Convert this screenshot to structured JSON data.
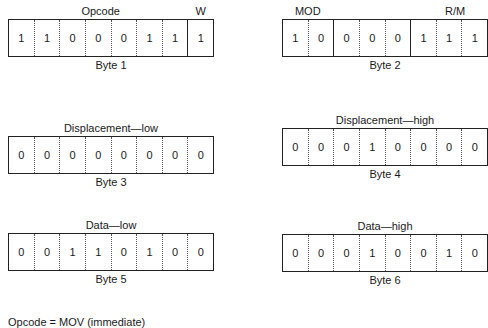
{
  "bytes": [
    {
      "caption": "Byte 1",
      "field_labels": [
        {
          "text": "Opcode",
          "center_pct": 45
        },
        {
          "text": "W",
          "center_pct": 93.5
        }
      ],
      "bits": [
        "1",
        "1",
        "0",
        "0",
        "0",
        "1",
        "1",
        "1"
      ],
      "solid_dividers_before": [
        7
      ]
    },
    {
      "caption": "Byte 2",
      "field_labels": [
        {
          "text": "MOD",
          "center_pct": 12.5
        },
        {
          "text": "R/M",
          "center_pct": 84
        }
      ],
      "bits": [
        "1",
        "0",
        "0",
        "0",
        "0",
        "1",
        "1",
        "1"
      ],
      "solid_dividers_before": [
        2,
        5
      ]
    },
    {
      "caption": "Byte 3",
      "field_labels": [
        {
          "text": "Displacement—low",
          "center_pct": 50
        }
      ],
      "bits": [
        "0",
        "0",
        "0",
        "0",
        "0",
        "0",
        "0",
        "0"
      ],
      "solid_dividers_before": []
    },
    {
      "caption": "Byte 4",
      "field_labels": [
        {
          "text": "Displacement—high",
          "center_pct": 50
        }
      ],
      "bits": [
        "0",
        "0",
        "0",
        "1",
        "0",
        "0",
        "0",
        "0"
      ],
      "solid_dividers_before": []
    },
    {
      "caption": "Byte 5",
      "field_labels": [
        {
          "text": "Data—low",
          "center_pct": 50
        }
      ],
      "bits": [
        "0",
        "0",
        "1",
        "1",
        "0",
        "1",
        "0",
        "0"
      ],
      "solid_dividers_before": []
    },
    {
      "caption": "Byte 6",
      "field_labels": [
        {
          "text": "Data—high",
          "center_pct": 50
        }
      ],
      "bits": [
        "0",
        "0",
        "0",
        "1",
        "0",
        "0",
        "1",
        "0"
      ],
      "solid_dividers_before": []
    }
  ],
  "footer": {
    "text": "Opcode = MOV (immediate)"
  }
}
